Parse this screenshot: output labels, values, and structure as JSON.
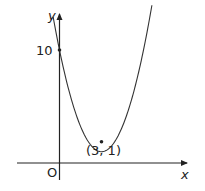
{
  "chart_data": {
    "type": "line",
    "title": "",
    "xlabel": "x",
    "ylabel": "y",
    "function": "y = (x - 3)^2 + 1",
    "series": [
      {
        "name": "parabola",
        "x": [
          -0.5,
          0,
          1,
          2,
          3,
          4,
          5,
          6,
          6.6
        ],
        "y": [
          13.25,
          10,
          5,
          2,
          1,
          2,
          5,
          10,
          13.96
        ]
      }
    ],
    "points": [
      {
        "label": "10",
        "x": 0,
        "y": 10
      },
      {
        "label": "(3, 1)",
        "x": 3,
        "y": 1
      }
    ],
    "origin_label": "O",
    "grid": false,
    "legend": "none"
  },
  "labels": {
    "x_axis": "x",
    "y_axis": "y",
    "origin": "O",
    "y_intercept": "10",
    "vertex": "(3, 1)"
  }
}
